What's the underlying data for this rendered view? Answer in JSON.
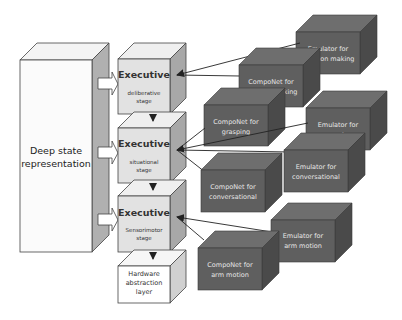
{
  "diagram": {
    "deep_state": {
      "line1": "Deep state",
      "line2": "representation"
    },
    "executives": [
      {
        "title": "Executive",
        "line1": "deliberative",
        "line2": "stage"
      },
      {
        "title": "Executive",
        "line1": "situational",
        "line2": "stage"
      },
      {
        "title": "Executive",
        "line1": "Sensorimotor",
        "line2": "stage"
      }
    ],
    "hardware": {
      "line1": "Hardware",
      "line2": "abstraction",
      "line3": "layer"
    },
    "modules": [
      {
        "id": "emulator-decision",
        "line1": "Emulator for",
        "line2": "decision making"
      },
      {
        "id": "componet-decision",
        "line1": "CompoNet for",
        "line2": "decision making"
      },
      {
        "id": "componet-grasping",
        "line1": "CompoNet for",
        "line2": "grasping"
      },
      {
        "id": "emulator-grasping",
        "line1": "Emulator for",
        "line2": "grasping"
      },
      {
        "id": "emulator-conversational",
        "line1": "Emulator for",
        "line2": "conversational"
      },
      {
        "id": "componet-conversational",
        "line1": "CompoNet for",
        "line2": "conversational"
      },
      {
        "id": "emulator-arm",
        "line1": "Emulator for",
        "line2": "arm motion"
      },
      {
        "id": "componet-arm",
        "line1": "CompoNet for",
        "line2": "arm motion"
      }
    ],
    "colors": {
      "light_front": "#e2e2e2",
      "light_top": "#f0f0f0",
      "light_side": "#a9a9a9",
      "white_front": "#ffffff",
      "dark_front": "#5f5f5f",
      "dark_top": "#6e6e6e",
      "dark_side": "#4a4a4a",
      "dark_text": "#e6e6e6",
      "stroke": "#333333"
    }
  }
}
